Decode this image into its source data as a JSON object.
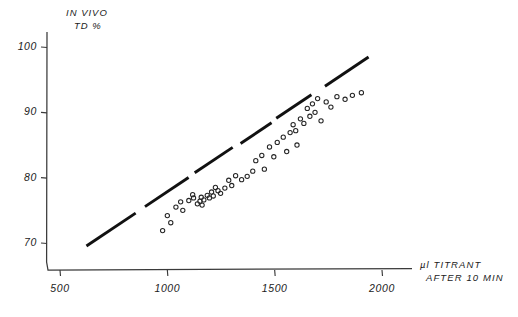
{
  "chart_data": {
    "type": "scatter",
    "title": "",
    "ylabel": "IN VIVO TD %",
    "ylabel_line1": "IN VIVO",
    "ylabel_line2": "TD %",
    "xlabel": "µl TITRANT AFTER 10 MIN",
    "xlabel_line1": "µl  TITRANT",
    "xlabel_line2": "AFTER  10 MIN",
    "xlim": [
      270,
      2170
    ],
    "ylim": [
      66.5,
      102.5
    ],
    "xticks": [
      500,
      1000,
      1500,
      2000
    ],
    "yticks": [
      70,
      80,
      90,
      100
    ],
    "xtick_labels": [
      "500",
      "1000",
      "1500",
      "2000"
    ],
    "ytick_labels": [
      "70",
      "80",
      "90",
      "100"
    ],
    "grid": false,
    "legend": "none",
    "marker": "open-circle",
    "series": [
      {
        "name": "samples",
        "points": [
          [
            978,
            71.9
          ],
          [
            1000,
            74.2
          ],
          [
            1016,
            73.1
          ],
          [
            1040,
            75.5
          ],
          [
            1062,
            76.3
          ],
          [
            1072,
            75.0
          ],
          [
            1100,
            76.5
          ],
          [
            1118,
            77.4
          ],
          [
            1122,
            76.9
          ],
          [
            1140,
            76.0
          ],
          [
            1152,
            76.4
          ],
          [
            1158,
            77.0
          ],
          [
            1162,
            75.8
          ],
          [
            1170,
            76.6
          ],
          [
            1186,
            77.3
          ],
          [
            1196,
            76.9
          ],
          [
            1206,
            77.8
          ],
          [
            1214,
            77.2
          ],
          [
            1224,
            78.5
          ],
          [
            1236,
            78.0
          ],
          [
            1248,
            77.6
          ],
          [
            1268,
            78.4
          ],
          [
            1286,
            79.6
          ],
          [
            1300,
            78.8
          ],
          [
            1318,
            80.3
          ],
          [
            1346,
            79.7
          ],
          [
            1372,
            80.2
          ],
          [
            1398,
            81.0
          ],
          [
            1412,
            82.6
          ],
          [
            1440,
            83.4
          ],
          [
            1452,
            81.3
          ],
          [
            1476,
            84.7
          ],
          [
            1496,
            83.2
          ],
          [
            1512,
            85.4
          ],
          [
            1540,
            86.2
          ],
          [
            1556,
            84.0
          ],
          [
            1572,
            86.9
          ],
          [
            1586,
            88.1
          ],
          [
            1598,
            87.2
          ],
          [
            1604,
            85.0
          ],
          [
            1620,
            89.0
          ],
          [
            1636,
            88.3
          ],
          [
            1652,
            90.6
          ],
          [
            1664,
            89.4
          ],
          [
            1676,
            91.3
          ],
          [
            1688,
            90.0
          ],
          [
            1700,
            92.1
          ],
          [
            1716,
            88.7
          ],
          [
            1740,
            91.6
          ],
          [
            1762,
            90.8
          ],
          [
            1790,
            92.4
          ],
          [
            1828,
            92.0
          ],
          [
            1862,
            92.6
          ],
          [
            1904,
            93.0
          ]
        ]
      }
    ],
    "trendline": {
      "style": "dashed-thick",
      "x_start": 625,
      "y_start": 69.6,
      "x_end": 1935,
      "y_end": 98.4
    }
  }
}
